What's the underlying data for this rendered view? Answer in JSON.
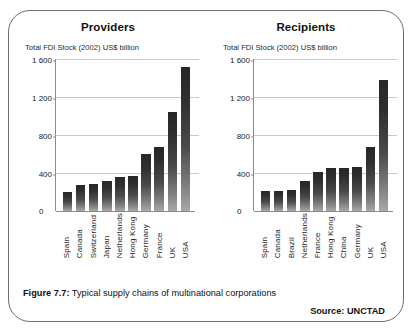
{
  "figure": {
    "caption_label": "Figure 7.7:",
    "caption_text": " Typical supply chains of multinational corporations",
    "source": "Source: UNCTAD"
  },
  "chart_data": [
    {
      "type": "bar",
      "title": "Providers",
      "subtitle": "Total FDI Stock (2002) US$ billion",
      "xlabel": "",
      "ylabel": "Total FDI Stock (2002) US$ billion",
      "ylim": [
        0,
        1600
      ],
      "yticks": [
        0,
        400,
        800,
        1200,
        1600
      ],
      "ytick_labels": [
        "0",
        "400",
        "800",
        "1 200",
        "1 600"
      ],
      "grid": true,
      "legend": "none",
      "categories": [
        "Spain",
        "Canada",
        "Switzerland",
        "Japan",
        "Netherlands",
        "Hong Kong",
        "Germany",
        "France",
        "UK",
        "USA"
      ],
      "values": [
        205,
        270,
        285,
        315,
        355,
        370,
        600,
        670,
        1040,
        1520
      ]
    },
    {
      "type": "bar",
      "title": "Recipients",
      "subtitle": "Total FDI Stock (2002) US$ billion",
      "xlabel": "",
      "ylabel": "Total FDI Stock (2002) US$ billion",
      "ylim": [
        0,
        1600
      ],
      "yticks": [
        0,
        400,
        800,
        1200,
        1600
      ],
      "ytick_labels": [
        "0",
        "400",
        "800",
        "1 200",
        "1 600"
      ],
      "grid": true,
      "legend": "none",
      "categories": [
        "Spain",
        "Canada",
        "Brazil",
        "Netherlands",
        "France",
        "Hong Kong",
        "China",
        "Germany",
        "UK",
        "USA"
      ],
      "values": [
        215,
        215,
        225,
        320,
        410,
        450,
        455,
        465,
        670,
        1380
      ]
    }
  ]
}
